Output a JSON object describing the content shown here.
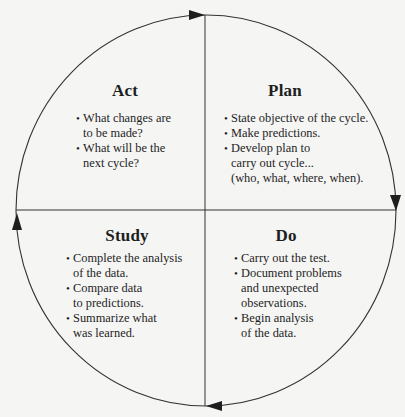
{
  "diagram": {
    "type": "PDSA cycle",
    "colors": {
      "background": "#f5f5f4",
      "line": "#333333",
      "text": "#1e1e1e"
    },
    "flow_direction": "clockwise",
    "arrows": [
      {
        "position": "top",
        "direction": "right"
      },
      {
        "position": "right",
        "direction": "down"
      },
      {
        "position": "bottom",
        "direction": "left"
      },
      {
        "position": "left",
        "direction": "up"
      }
    ],
    "quadrants": {
      "act": {
        "title": "Act",
        "position": "top-left",
        "items": [
          {
            "line1": "What changes are",
            "line2": "to be made?"
          },
          {
            "line1": "What will be the",
            "line2": "next cycle?"
          }
        ]
      },
      "plan": {
        "title": "Plan",
        "position": "top-right",
        "items": [
          {
            "line1": "State objective of the cycle."
          },
          {
            "line1": "Make predictions."
          },
          {
            "line1": "Develop plan to",
            "line2": "carry out cycle...",
            "line3": "(who, what, where, when)."
          }
        ]
      },
      "study": {
        "title": "Study",
        "position": "bottom-left",
        "items": [
          {
            "line1": "Complete the analysis",
            "line2": "of the data."
          },
          {
            "line1": "Compare data",
            "line2": "to predictions."
          },
          {
            "line1": "Summarize what",
            "line2": "was learned."
          }
        ]
      },
      "do": {
        "title": "Do",
        "position": "bottom-right",
        "items": [
          {
            "line1": "Carry out the test."
          },
          {
            "line1": "Document problems",
            "line2": "and unexpected",
            "line3": "observations."
          },
          {
            "line1": "Begin analysis",
            "line2": "of the data."
          }
        ]
      }
    }
  }
}
